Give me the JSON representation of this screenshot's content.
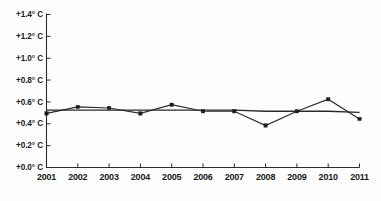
{
  "chart_data": {
    "type": "line",
    "title": "",
    "subtitle": "",
    "xlabel": "",
    "ylabel": "",
    "categories": [
      "2001",
      "2002",
      "2003",
      "2004",
      "2005",
      "2006",
      "2007",
      "2008",
      "2009",
      "2010",
      "2011"
    ],
    "x": [
      2001,
      2002,
      2003,
      2004,
      2005,
      2006,
      2007,
      2008,
      2009,
      2010,
      2011
    ],
    "series": [
      {
        "name": "Temperature anomaly",
        "values": [
          0.49,
          0.55,
          0.54,
          0.49,
          0.57,
          0.51,
          0.51,
          0.38,
          0.51,
          0.62,
          0.44
        ],
        "marker": "square",
        "color": "#1c1c1c"
      },
      {
        "name": "Trend",
        "values": [
          0.52,
          0.52,
          0.52,
          0.52,
          0.52,
          0.52,
          0.52,
          0.51,
          0.51,
          0.51,
          0.5
        ],
        "marker": "none",
        "color": "#2a2a2a"
      }
    ],
    "ylim": [
      0.0,
      1.4
    ],
    "xlim": [
      2001,
      2011
    ],
    "yticks": [
      0.0,
      0.2,
      0.4,
      0.6,
      0.8,
      1.0,
      1.2,
      1.4
    ],
    "ytick_labels": [
      "+0.0° C",
      "+0.2° C",
      "+0.4° C",
      "+0.6° C",
      "+0.8° C",
      "+1.0° C",
      "+1.2° C",
      "+1.4° C"
    ],
    "xtick_labels": [
      "2001",
      "2002",
      "2003",
      "2004",
      "2005",
      "2006",
      "2007",
      "2008",
      "2009",
      "2010",
      "2011"
    ],
    "grid": false,
    "legend": null,
    "legend_position": "none",
    "annotations": [],
    "unit": "° C",
    "background_color": "#fdfdfd",
    "axis_color": "#2b2b2b",
    "series_color": "#1c1c1c"
  }
}
